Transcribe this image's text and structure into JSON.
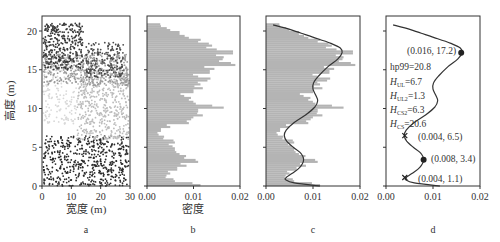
{
  "figure": {
    "panels": [
      "a",
      "b",
      "c",
      "d"
    ]
  },
  "chart_data": [
    {
      "panel": "a",
      "type": "scatter",
      "title": "",
      "xlabel": "宽度 (m)",
      "ylabel": "高度 (m)",
      "xlim": [
        0,
        30
      ],
      "ylim": [
        0,
        22
      ],
      "xticks": [
        0,
        10,
        20,
        30
      ],
      "yticks": [
        0,
        5,
        10,
        15,
        20
      ],
      "grid": false,
      "color_encoding": "grayscale by height: dark near ground (0–6 m) and crown top (17–21 m), light gray mid-canopy (8–15 m)",
      "point_clusters": [
        {
          "name": "understory",
          "x_range": [
            0,
            30
          ],
          "y_range": [
            0,
            6.5
          ],
          "color": "#2a2a2a",
          "count": 520
        },
        {
          "name": "mid-canopy-left",
          "x_range": [
            0,
            12
          ],
          "y_range": [
            8,
            16
          ],
          "color": "#d8d8d8",
          "count": 160
        },
        {
          "name": "mid-canopy-right",
          "x_range": [
            12,
            30
          ],
          "y_range": [
            6,
            15
          ],
          "color": "#bcbcbc",
          "count": 480
        },
        {
          "name": "upper-canopy",
          "x_range": [
            0,
            30
          ],
          "y_range": [
            13,
            17
          ],
          "color": "#9a9a9a",
          "count": 420
        },
        {
          "name": "crown-top-left",
          "x_range": [
            0,
            14
          ],
          "y_range": [
            15,
            21
          ],
          "color": "#3a3a3a",
          "count": 330
        },
        {
          "name": "crown-top-right",
          "x_range": [
            15,
            28
          ],
          "y_range": [
            14,
            18.5
          ],
          "color": "#4a4a4a",
          "count": 180
        }
      ]
    },
    {
      "panel": "b",
      "type": "bar",
      "orientation": "horizontal",
      "title": "",
      "xlabel": "密度",
      "ylabel": "",
      "xlim": [
        0,
        0.02
      ],
      "ylim": [
        0,
        22
      ],
      "xticks": [
        "0.00",
        "0.01",
        "0.02"
      ],
      "yticks": [
        0,
        5,
        10,
        15,
        20
      ],
      "bar_color": "#b4b4b4",
      "bin_height_m": 0.25,
      "bins": [
        {
          "y": 0.0,
          "density": 0.0115
        },
        {
          "y": 0.5,
          "density": 0.006
        },
        {
          "y": 1.0,
          "density": 0.004
        },
        {
          "y": 1.5,
          "density": 0.005
        },
        {
          "y": 2.0,
          "density": 0.0065
        },
        {
          "y": 2.5,
          "density": 0.0085
        },
        {
          "y": 3.0,
          "density": 0.011
        },
        {
          "y": 3.5,
          "density": 0.008
        },
        {
          "y": 4.0,
          "density": 0.007
        },
        {
          "y": 4.5,
          "density": 0.006
        },
        {
          "y": 5.0,
          "density": 0.0055
        },
        {
          "y": 5.5,
          "density": 0.006
        },
        {
          "y": 6.0,
          "density": 0.0035
        },
        {
          "y": 6.5,
          "density": 0.0025
        },
        {
          "y": 7.0,
          "density": 0.003
        },
        {
          "y": 7.5,
          "density": 0.005
        },
        {
          "y": 8.0,
          "density": 0.009
        },
        {
          "y": 8.5,
          "density": 0.0095
        },
        {
          "y": 9.0,
          "density": 0.012
        },
        {
          "y": 9.5,
          "density": 0.011
        },
        {
          "y": 10.0,
          "density": 0.0165
        },
        {
          "y": 10.5,
          "density": 0.0105
        },
        {
          "y": 11.0,
          "density": 0.009
        },
        {
          "y": 11.5,
          "density": 0.008
        },
        {
          "y": 12.0,
          "density": 0.01
        },
        {
          "y": 12.5,
          "density": 0.012
        },
        {
          "y": 13.0,
          "density": 0.0115
        },
        {
          "y": 13.5,
          "density": 0.013
        },
        {
          "y": 14.0,
          "density": 0.011
        },
        {
          "y": 14.5,
          "density": 0.0135
        },
        {
          "y": 15.0,
          "density": 0.0145
        },
        {
          "y": 15.5,
          "density": 0.019
        },
        {
          "y": 16.0,
          "density": 0.0155
        },
        {
          "y": 16.5,
          "density": 0.0165
        },
        {
          "y": 17.0,
          "density": 0.0185
        },
        {
          "y": 17.5,
          "density": 0.015
        },
        {
          "y": 18.0,
          "density": 0.014
        },
        {
          "y": 18.5,
          "density": 0.011
        },
        {
          "y": 19.0,
          "density": 0.009
        },
        {
          "y": 19.5,
          "density": 0.007
        },
        {
          "y": 20.0,
          "density": 0.005
        },
        {
          "y": 20.5,
          "density": 0.003
        }
      ]
    },
    {
      "panel": "c",
      "type": "bar+line",
      "orientation": "horizontal",
      "title": "",
      "xlabel": "",
      "xlim": [
        0,
        0.02
      ],
      "ylim": [
        0,
        22
      ],
      "xticks": [
        "0.00",
        "0.01",
        "0.02"
      ],
      "yticks": [
        0,
        5,
        10,
        15,
        20
      ],
      "description": "histogram from panel b overlaid with kernel density estimate curve",
      "kde_curve": {
        "x": [
          0.0115,
          0.006,
          0.0042,
          0.0043,
          0.0055,
          0.0072,
          0.008,
          0.0073,
          0.0058,
          0.0044,
          0.0039,
          0.0043,
          0.006,
          0.0085,
          0.0104,
          0.011,
          0.0106,
          0.01,
          0.0101,
          0.0112,
          0.0132,
          0.0153,
          0.0162,
          0.0158,
          0.0138,
          0.011,
          0.0075,
          0.004,
          0.0015
        ],
        "y": [
          0.0,
          0.4,
          0.8,
          1.1,
          1.6,
          2.4,
          3.4,
          4.3,
          5.0,
          5.8,
          6.5,
          7.2,
          8.2,
          9.2,
          10.2,
          11.0,
          11.7,
          12.5,
          13.3,
          14.2,
          15.4,
          16.4,
          17.2,
          17.8,
          18.4,
          19.0,
          19.7,
          20.4,
          20.8
        ]
      }
    },
    {
      "panel": "d",
      "type": "line",
      "orientation": "horizontal",
      "title": "",
      "xlabel": "",
      "xlim": [
        0,
        0.02
      ],
      "ylim": [
        0,
        22
      ],
      "xticks": [
        "0.00",
        "0.01",
        "0.02"
      ],
      "yticks": [
        0,
        5,
        10,
        15,
        20
      ],
      "description": "kernel density curve with annotated peaks (●) and troughs (×)",
      "peaks": [
        {
          "x": 0.016,
          "y": 17.2,
          "label": "(0.016, 17.2)"
        },
        {
          "x": 0.008,
          "y": 3.4,
          "label": "(0.008, 3.4)"
        }
      ],
      "troughs": [
        {
          "x": 0.004,
          "y": 6.5,
          "label": "(0.004, 6.5)"
        },
        {
          "x": 0.004,
          "y": 1.1,
          "label": "(0.004, 1.1)"
        }
      ],
      "annotations": [
        "hp99=20.8",
        "H_UL=6.7",
        "H_UL2=1.3",
        "H_CS2=6.3",
        "H_CS=20.6"
      ]
    }
  ],
  "labels": {
    "a": {
      "xlabel": "宽度 (m)",
      "ylabel": "高度 (m)",
      "panel": "a"
    },
    "b": {
      "xlabel": "密度",
      "panel": "b"
    },
    "c": {
      "panel": "c"
    },
    "d": {
      "panel": "d",
      "peak1": "(0.016, 17.2)",
      "peak2": "(0.008, 3.4)",
      "trough1": "(0.004, 6.5)",
      "trough2": "(0.004, 1.1)",
      "hp99": "hp99=20.8",
      "hul_val": "=6.7",
      "hul2_val": "=1.3",
      "hcs2_val": "=6.3",
      "hcs_val": "=20.6",
      "H": "H",
      "sub_ul": "UL",
      "sub_ul2": "UL2",
      "sub_cs2": "CS2",
      "sub_cs": "CS"
    },
    "xticks_a": [
      "0",
      "10",
      "20",
      "30"
    ],
    "xticks_density": [
      "0.00",
      "0.01",
      "0.02"
    ],
    "yticks": [
      "0",
      "5",
      "10",
      "15",
      "20"
    ]
  }
}
